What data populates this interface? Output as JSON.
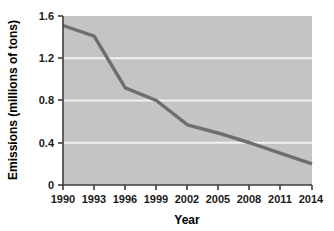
{
  "chart_data": {
    "type": "line",
    "title": "",
    "xlabel": "Year",
    "ylabel": "Emissions (millions of tons)",
    "x": [
      1990,
      1993,
      1996,
      1999,
      2002,
      2005,
      2008,
      2011,
      2014
    ],
    "values": [
      1.51,
      1.41,
      0.92,
      0.8,
      0.57,
      0.49,
      0.4,
      0.3,
      0.2
    ],
    "series": [
      {
        "name": "Emissions",
        "values": [
          1.51,
          1.41,
          0.92,
          0.8,
          0.57,
          0.49,
          0.4,
          0.3,
          0.2
        ]
      }
    ],
    "xlim": [
      1990,
      2014
    ],
    "ylim": [
      0,
      1.6
    ],
    "xticks": [
      "1990",
      "1993",
      "1996",
      "1999",
      "2002",
      "2005",
      "2008",
      "2011",
      "2014"
    ],
    "yticks": [
      "0",
      "0.4",
      "0.8",
      "1.2",
      "1.6"
    ],
    "ytick_values": [
      0,
      0.4,
      0.8,
      1.2,
      1.6
    ],
    "gridlines": [
      0.4,
      0.8,
      1.2
    ],
    "grid": true,
    "legend": "none",
    "colors": {
      "plot_background": "#c4c4c4",
      "line": "#6e6e6e",
      "gridline": "#f2f2f2",
      "axis": "#3d3d3d",
      "text": "#1a1a1a",
      "page_background": "#ffffff"
    }
  }
}
